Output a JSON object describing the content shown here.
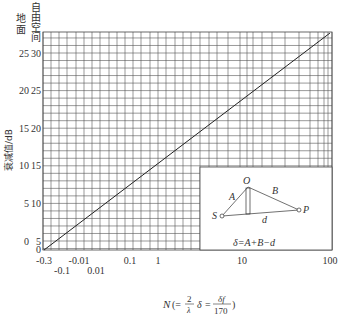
{
  "chart_data": {
    "type": "line",
    "title": "",
    "xlabel": "N(= 2/λ · δ = δf/170)",
    "xlabel_parts": {
      "N": "N",
      "open": "(=",
      "frac1_num": "2",
      "frac1_den": "λ",
      "delta": "δ",
      "eq": "=",
      "frac2_num": "δf",
      "frac2_den": "170",
      "close": ")"
    },
    "ylabel": "衰减值/dB",
    "y_column_headers": {
      "ground": "地面",
      "free_space": "自由空间"
    },
    "x_scale": "log (with negative region near origin)",
    "x_tick_labels_row1": [
      "-0.3",
      "-0.01",
      "0.1",
      "1",
      "10",
      "100"
    ],
    "x_tick_labels_row2": [
      "-0.1",
      "0.01"
    ],
    "y_ticks_ground": [
      0,
      5,
      10,
      15,
      20,
      25
    ],
    "y_ticks_free_space": [
      5,
      10,
      15,
      20,
      25,
      30
    ],
    "origin_label": "0",
    "grid": true,
    "series": [
      {
        "name": "Attenuation",
        "x": [
          -0.3,
          100
        ],
        "y_free_space": [
          0,
          32
        ],
        "y_ground": [
          -5,
          27
        ]
      }
    ],
    "inset": {
      "points": {
        "O": "O",
        "S": "S",
        "P": "P"
      },
      "segments": {
        "A": "A",
        "B": "B",
        "d": "d"
      },
      "formula": "δ=A+B−d"
    }
  }
}
